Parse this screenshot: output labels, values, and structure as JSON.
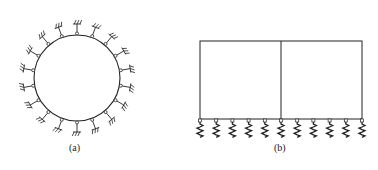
{
  "figures": [
    {
      "id": "a",
      "caption": "(a)",
      "description": "Circular ring supported by radial elastic supports (springs) around its circumference",
      "shape": "circle",
      "center": [
        77,
        78
      ],
      "radius": 43,
      "support_count": 18,
      "support_type": "radial-ground-spring"
    },
    {
      "id": "b",
      "caption": "(b)",
      "description": "Two-bay frame resting on elastic foundation springs",
      "shape": "rectangle-two-bays",
      "rect": {
        "x": 200,
        "y": 41,
        "w": 162,
        "h": 78
      },
      "spring_count": 11,
      "support_type": "vertical-spring"
    }
  ],
  "colors": {
    "line": "#222222",
    "background": "#ffffff"
  }
}
